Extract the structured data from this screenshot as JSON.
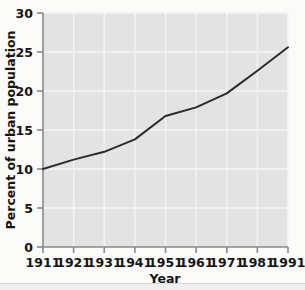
{
  "figure": {
    "background_color": "#fbfbfa",
    "plot_background_color": "#e3e3e3",
    "gridline_color": "#f4f4f4",
    "line_color": "#2b2b2b",
    "axis_color": "#8a8a8a",
    "text_color": "#141414"
  },
  "chart_data": {
    "type": "line",
    "title": "",
    "subtitle": "",
    "xlabel": "Year",
    "ylabel": "Percent of urban population",
    "x": [
      1911,
      1921,
      1931,
      1941,
      1951,
      1961,
      1971,
      1981,
      1991
    ],
    "categories": [
      "1911",
      "1921",
      "1931",
      "1941",
      "1951",
      "1961",
      "1971",
      "1981",
      "1991"
    ],
    "values": [
      10.0,
      11.2,
      12.2,
      13.8,
      16.8,
      17.9,
      19.7,
      22.6,
      25.6
    ],
    "series": [
      {
        "name": "Percent of urban population",
        "values": [
          10.0,
          11.2,
          12.2,
          13.8,
          16.8,
          17.9,
          19.7,
          22.6,
          25.6
        ]
      }
    ],
    "xlim": [
      1911,
      1991
    ],
    "ylim": [
      0,
      30
    ],
    "xticks": [
      1911,
      1921,
      1931,
      1941,
      1951,
      1961,
      1971,
      1981,
      1991
    ],
    "xtick_labels": [
      "1911",
      "1921",
      "1931",
      "1941",
      "1951",
      "1961",
      "1971",
      "1981",
      "1991"
    ],
    "yticks": [
      0,
      5,
      10,
      15,
      20,
      25,
      30
    ],
    "ytick_labels": [
      "0",
      "5",
      "10",
      "15",
      "20",
      "25",
      "30"
    ],
    "grid": true,
    "grid_axis": "both",
    "legend": false,
    "legend_position": "none",
    "annotations": []
  }
}
